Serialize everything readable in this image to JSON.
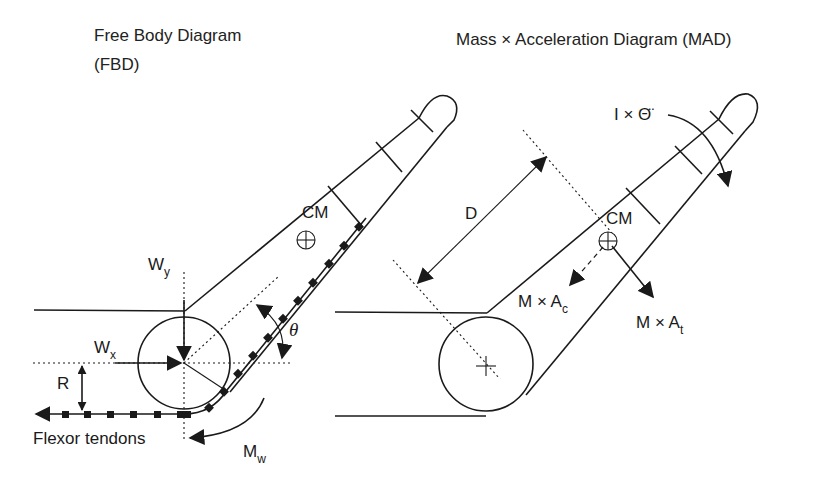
{
  "fbd": {
    "title_line1": "Free Body Diagram",
    "title_line2": "(FBD)",
    "labels": {
      "cm": "CM",
      "wy_main": "W",
      "wy_sub": "y",
      "wx_main": "W",
      "wx_sub": "x",
      "theta": "θ",
      "r": "R",
      "flexor": "Flexor tendons",
      "mw_main": "M",
      "mw_sub": "w"
    }
  },
  "mad": {
    "title": "Mass × Acceleration Diagram (MAD)",
    "labels": {
      "inertia": "I × Θ̈",
      "d": "D",
      "cm": "CM",
      "mac_main": "M × A",
      "mac_sub": "c",
      "mat_main": "M × A",
      "mat_sub": "t"
    }
  },
  "colors": {
    "ink": "#1a1a1a",
    "background": "#ffffff"
  }
}
